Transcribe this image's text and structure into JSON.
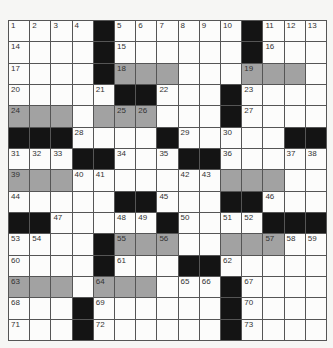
{
  "puzzle": {
    "rows": 15,
    "cols": 15,
    "colors": {
      "black": "#141414",
      "shaded": "#a2a2a2",
      "white": "#fcfcfb",
      "grid_line": "#555555"
    },
    "layout": [
      "....#......#...",
      "....#......#...",
      "....#ggg...ggg.",
      ".....##...#....",
      "ggg.ggg...#....",
      "###....#.....##",
      "...##...##.....",
      "ggg.......ggg..",
      ".....##...##...",
      "##.....#....###",
      "....#ggg..ggg..",
      "....#...##.....",
      "ggg.ggg...#....",
      "...#......#....",
      "...#......#...."
    ],
    "numbers": [
      {
        "r": 0,
        "c": 0,
        "n": "1"
      },
      {
        "r": 0,
        "c": 1,
        "n": "2"
      },
      {
        "r": 0,
        "c": 2,
        "n": "3"
      },
      {
        "r": 0,
        "c": 3,
        "n": "4"
      },
      {
        "r": 0,
        "c": 5,
        "n": "5"
      },
      {
        "r": 0,
        "c": 6,
        "n": "6"
      },
      {
        "r": 0,
        "c": 7,
        "n": "7"
      },
      {
        "r": 0,
        "c": 8,
        "n": "8"
      },
      {
        "r": 0,
        "c": 9,
        "n": "9"
      },
      {
        "r": 0,
        "c": 10,
        "n": "10"
      },
      {
        "r": 0,
        "c": 12,
        "n": "11"
      },
      {
        "r": 0,
        "c": 13,
        "n": "12"
      },
      {
        "r": 0,
        "c": 14,
        "n": "13"
      },
      {
        "r": 1,
        "c": 0,
        "n": "14"
      },
      {
        "r": 1,
        "c": 5,
        "n": "15"
      },
      {
        "r": 1,
        "c": 12,
        "n": "16"
      },
      {
        "r": 2,
        "c": 0,
        "n": "17"
      },
      {
        "r": 2,
        "c": 5,
        "n": "18"
      },
      {
        "r": 2,
        "c": 11,
        "n": "19"
      },
      {
        "r": 3,
        "c": 0,
        "n": "20"
      },
      {
        "r": 3,
        "c": 4,
        "n": "21"
      },
      {
        "r": 3,
        "c": 7,
        "n": "22"
      },
      {
        "r": 3,
        "c": 11,
        "n": "23"
      },
      {
        "r": 4,
        "c": 0,
        "n": "24"
      },
      {
        "r": 4,
        "c": 5,
        "n": "25"
      },
      {
        "r": 4,
        "c": 6,
        "n": "26"
      },
      {
        "r": 4,
        "c": 11,
        "n": "27"
      },
      {
        "r": 5,
        "c": 3,
        "n": "28"
      },
      {
        "r": 5,
        "c": 8,
        "n": "29"
      },
      {
        "r": 5,
        "c": 10,
        "n": "30"
      },
      {
        "r": 6,
        "c": 0,
        "n": "31"
      },
      {
        "r": 6,
        "c": 1,
        "n": "32"
      },
      {
        "r": 6,
        "c": 2,
        "n": "33"
      },
      {
        "r": 6,
        "c": 5,
        "n": "34"
      },
      {
        "r": 6,
        "c": 7,
        "n": "35"
      },
      {
        "r": 6,
        "c": 10,
        "n": "36"
      },
      {
        "r": 6,
        "c": 13,
        "n": "37"
      },
      {
        "r": 6,
        "c": 14,
        "n": "38"
      },
      {
        "r": 7,
        "c": 0,
        "n": "39"
      },
      {
        "r": 7,
        "c": 3,
        "n": "40"
      },
      {
        "r": 7,
        "c": 4,
        "n": "41"
      },
      {
        "r": 7,
        "c": 8,
        "n": "42"
      },
      {
        "r": 7,
        "c": 9,
        "n": "43"
      },
      {
        "r": 8,
        "c": 0,
        "n": "44"
      },
      {
        "r": 8,
        "c": 7,
        "n": "45"
      },
      {
        "r": 8,
        "c": 12,
        "n": "46"
      },
      {
        "r": 9,
        "c": 2,
        "n": "47"
      },
      {
        "r": 9,
        "c": 5,
        "n": "48"
      },
      {
        "r": 9,
        "c": 6,
        "n": "49"
      },
      {
        "r": 9,
        "c": 8,
        "n": "50"
      },
      {
        "r": 9,
        "c": 10,
        "n": "51"
      },
      {
        "r": 9,
        "c": 11,
        "n": "52"
      },
      {
        "r": 10,
        "c": 0,
        "n": "53"
      },
      {
        "r": 10,
        "c": 1,
        "n": "54"
      },
      {
        "r": 10,
        "c": 5,
        "n": "55"
      },
      {
        "r": 10,
        "c": 7,
        "n": "56"
      },
      {
        "r": 10,
        "c": 12,
        "n": "57"
      },
      {
        "r": 10,
        "c": 13,
        "n": "58"
      },
      {
        "r": 10,
        "c": 14,
        "n": "59"
      },
      {
        "r": 11,
        "c": 0,
        "n": "60"
      },
      {
        "r": 11,
        "c": 5,
        "n": "61"
      },
      {
        "r": 11,
        "c": 10,
        "n": "62"
      },
      {
        "r": 12,
        "c": 0,
        "n": "63"
      },
      {
        "r": 12,
        "c": 4,
        "n": "64"
      },
      {
        "r": 12,
        "c": 8,
        "n": "65"
      },
      {
        "r": 12,
        "c": 9,
        "n": "66"
      },
      {
        "r": 12,
        "c": 11,
        "n": "67"
      },
      {
        "r": 13,
        "c": 0,
        "n": "68"
      },
      {
        "r": 13,
        "c": 4,
        "n": "69"
      },
      {
        "r": 13,
        "c": 11,
        "n": "70"
      },
      {
        "r": 14,
        "c": 0,
        "n": "71"
      },
      {
        "r": 14,
        "c": 4,
        "n": "72"
      },
      {
        "r": 14,
        "c": 11,
        "n": "73"
      }
    ]
  }
}
